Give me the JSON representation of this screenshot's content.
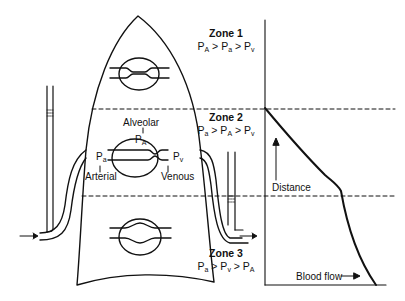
{
  "zones": [
    {
      "title": "Zone 1",
      "relation": [
        {
          "p": "P",
          "sub": "A"
        },
        {
          "op": " > "
        },
        {
          "p": "P",
          "sub": "a"
        },
        {
          "op": " > "
        },
        {
          "p": "P",
          "sub": "v"
        }
      ]
    },
    {
      "title": "Zone 2",
      "relation": [
        {
          "p": "P",
          "sub": "a"
        },
        {
          "op": " > "
        },
        {
          "p": "P",
          "sub": "A"
        },
        {
          "op": " > "
        },
        {
          "p": "P",
          "sub": "v"
        }
      ]
    },
    {
      "title": "Zone 3",
      "relation": [
        {
          "p": "P",
          "sub": "a"
        },
        {
          "op": " > "
        },
        {
          "p": "P",
          "sub": "v"
        },
        {
          "op": " > "
        },
        {
          "p": "P",
          "sub": "A"
        }
      ]
    }
  ],
  "capillary_labels": {
    "alveolar": "Alveolar",
    "alveolar_pressure": {
      "p": "P",
      "sub": "A"
    },
    "arterial_pressure": {
      "p": "P",
      "sub": "a"
    },
    "venous_pressure": {
      "p": "P",
      "sub": "v"
    },
    "arterial": "Arterial",
    "venous": "Venous"
  },
  "graph": {
    "y_axis_label": "Distance",
    "x_axis_label": "Blood flow",
    "arrow_glyph": "→"
  },
  "colors": {
    "line": "#111111",
    "background": "#ffffff"
  }
}
